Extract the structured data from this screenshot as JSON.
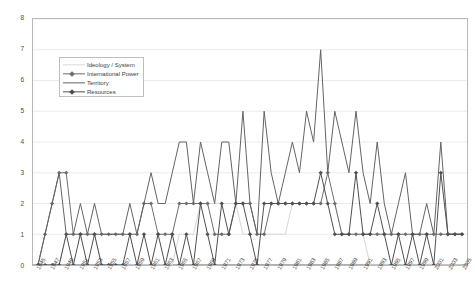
{
  "chart_data": {
    "type": "line",
    "title": "",
    "subtitle": "",
    "xlabel": "",
    "ylabel": "",
    "xlim": [
      1945,
      2005
    ],
    "ylim": [
      0,
      8
    ],
    "yticks": [
      0,
      1,
      2,
      3,
      4,
      5,
      6,
      7,
      8
    ],
    "grid": true,
    "legend_position": "upper-left-inside",
    "x": [
      1945,
      1946,
      1947,
      1948,
      1949,
      1950,
      1951,
      1952,
      1953,
      1954,
      1955,
      1956,
      1957,
      1958,
      1959,
      1960,
      1961,
      1962,
      1963,
      1964,
      1965,
      1966,
      1967,
      1968,
      1969,
      1970,
      1971,
      1972,
      1973,
      1974,
      1975,
      1976,
      1977,
      1978,
      1979,
      1980,
      1981,
      1982,
      1983,
      1984,
      1985,
      1986,
      1987,
      1988,
      1989,
      1990,
      1991,
      1992,
      1993,
      1994,
      1995,
      1996,
      1997,
      1998,
      1999,
      2000,
      2001,
      2002,
      2003,
      2004,
      2005
    ],
    "xtick_labels": [
      "1945",
      "1947",
      "1949",
      "1951",
      "1953",
      "1955",
      "1957",
      "1959",
      "1961",
      "1963",
      "1965",
      "1967",
      "1969",
      "1971",
      "1973",
      "1975",
      "1977",
      "1979",
      "1981",
      "1983",
      "1985",
      "1987",
      "1989",
      "1991",
      "1993",
      "1995",
      "1997",
      "1999",
      "2001",
      "2003",
      "2005"
    ],
    "series": [
      {
        "name": "Ideology / System",
        "color": "#d9d9d9",
        "marker": "none",
        "values": [
          0,
          0,
          0,
          0,
          1,
          1,
          1,
          1,
          1,
          0,
          0,
          0,
          0,
          0,
          0,
          0,
          0,
          0,
          0,
          0,
          1,
          1,
          1,
          2,
          2,
          2,
          2,
          2,
          2,
          1,
          1,
          1,
          1,
          1,
          1,
          1,
          2,
          2,
          2,
          2,
          2,
          2,
          2,
          1,
          1,
          1,
          1,
          0,
          0,
          0,
          0,
          0,
          0,
          0,
          0,
          0,
          0,
          0,
          0,
          0,
          0
        ]
      },
      {
        "name": "International Power",
        "color": "#6e6e6e",
        "marker": "diamond",
        "values": [
          0,
          1,
          2,
          3,
          3,
          1,
          1,
          1,
          1,
          1,
          1,
          1,
          1,
          1,
          1,
          2,
          2,
          1,
          1,
          1,
          2,
          2,
          2,
          2,
          2,
          1,
          1,
          1,
          2,
          2,
          2,
          1,
          1,
          2,
          2,
          2,
          2,
          2,
          2,
          2,
          2,
          3,
          2,
          1,
          1,
          1,
          1,
          1,
          1,
          1,
          1,
          1,
          1,
          1,
          1,
          1,
          1,
          1,
          1,
          1,
          1
        ]
      },
      {
        "name": "Territory",
        "color": "#636363",
        "marker": "none",
        "values": [
          0,
          1,
          2,
          3,
          1,
          1,
          2,
          1,
          2,
          1,
          1,
          1,
          1,
          2,
          1,
          2,
          3,
          2,
          2,
          3,
          4,
          4,
          2,
          4,
          3,
          2,
          4,
          4,
          2,
          5,
          2,
          1,
          5,
          3,
          2,
          3,
          4,
          3,
          5,
          4,
          7,
          3,
          5,
          4,
          3,
          5,
          3,
          2,
          4,
          2,
          1,
          2,
          3,
          1,
          1,
          2,
          1,
          4,
          1,
          1,
          1
        ]
      },
      {
        "name": "Resources",
        "color": "#4f4f4f",
        "marker": "diamond",
        "values": [
          0,
          0,
          0,
          0,
          1,
          0,
          1,
          0,
          1,
          0,
          0,
          0,
          0,
          1,
          0,
          1,
          0,
          1,
          0,
          1,
          0,
          1,
          0,
          2,
          1,
          0,
          2,
          1,
          2,
          2,
          1,
          0,
          2,
          2,
          2,
          2,
          2,
          2,
          2,
          2,
          3,
          2,
          1,
          1,
          1,
          3,
          1,
          1,
          2,
          1,
          0,
          1,
          0,
          1,
          0,
          1,
          0,
          3,
          1,
          1,
          1
        ]
      }
    ]
  },
  "legend": {
    "items": [
      {
        "label": "Ideology / System"
      },
      {
        "label": "International Power"
      },
      {
        "label": "Territory"
      },
      {
        "label": "Resources"
      }
    ]
  }
}
